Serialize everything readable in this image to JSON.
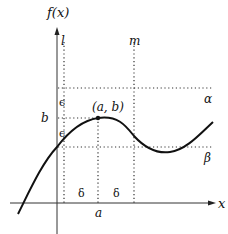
{
  "diagram": {
    "type": "function-graph",
    "title": "",
    "axes": {
      "y_label": "f(x)",
      "x_label": "x"
    },
    "vertical_lines": [
      {
        "id": "l",
        "label": "l"
      },
      {
        "id": "m",
        "label": "m"
      }
    ],
    "horizontal_lines": [
      {
        "id": "alpha",
        "label": "α"
      },
      {
        "id": "beta",
        "label": "β"
      }
    ],
    "point": {
      "label": "(a, b)"
    },
    "tick_labels": {
      "x_tick": "a",
      "y_tick": "b"
    },
    "interval_labels": {
      "epsilon_upper": "ϵ",
      "epsilon_lower": "ϵ",
      "delta_left": "δ",
      "delta_right": "δ"
    },
    "colors": {
      "curve": "#111111",
      "axes": "#333333",
      "dotted": "#333333",
      "background": "#ffffff"
    }
  }
}
